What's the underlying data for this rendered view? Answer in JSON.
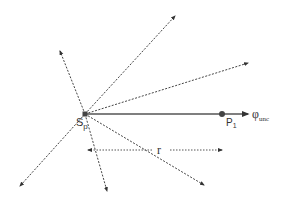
{
  "diagram": {
    "type": "ray-diagram",
    "colors": {
      "line": "#444444",
      "solid_ray": "#555555",
      "point": "#444444",
      "text": "#333333"
    },
    "source": {
      "label_main": "S",
      "label_sub": "p",
      "x": 85,
      "y": 114
    },
    "point": {
      "label_main": "P",
      "label_sub": "1",
      "x": 222,
      "y": 114
    },
    "solid_ray": {
      "label_main": "φ",
      "label_sub": "unc",
      "end_x": 248,
      "end_y": 114
    },
    "dashed_rays": [
      {
        "name": "ray-upper-left",
        "x": 60,
        "y": 51
      },
      {
        "name": "ray-upper-right",
        "x": 175,
        "y": 16
      },
      {
        "name": "ray-right",
        "x": 248,
        "y": 63
      },
      {
        "name": "ray-lower-right",
        "x": 204,
        "y": 185
      },
      {
        "name": "ray-lower-middle",
        "x": 107,
        "y": 191
      },
      {
        "name": "ray-lower-left",
        "x": 20,
        "y": 186
      }
    ],
    "distance": {
      "label": "r",
      "y": 150,
      "x_start": 88,
      "x_end": 222,
      "label_x": 160
    }
  }
}
